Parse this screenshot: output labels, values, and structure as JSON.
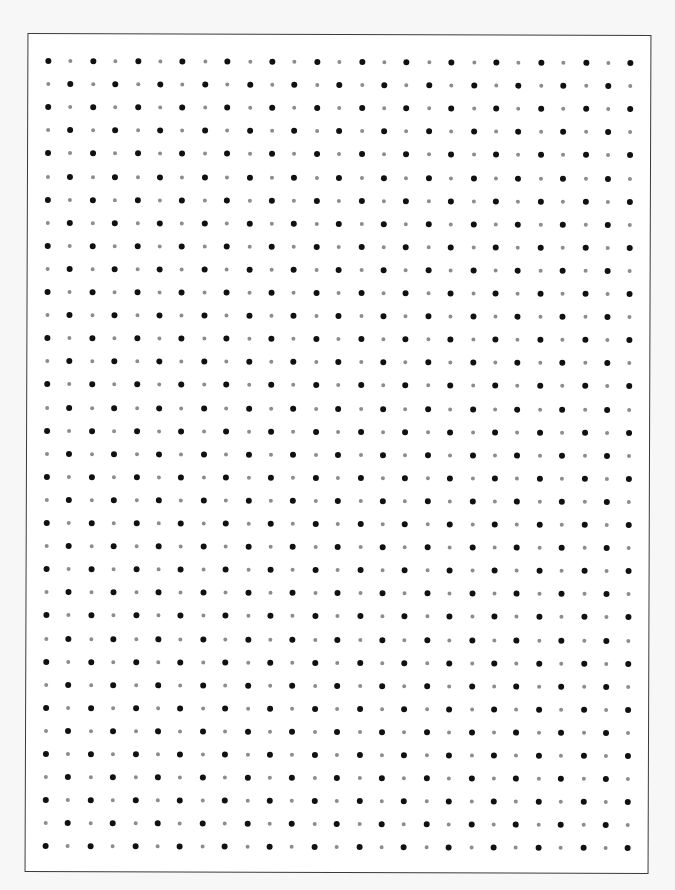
{
  "sheet": {
    "type": "dot-grid-paper",
    "columns": 27,
    "rows": 35,
    "pattern": "alternating-checkerboard",
    "first_dot": "dark",
    "spacing_x": 22.4,
    "spacing_y": 23.1,
    "origin_x": 20,
    "origin_y": 27,
    "colors": {
      "dark_dot": "#111111",
      "light_dot": "#8c8c8c",
      "border": "#3a3a3a",
      "paper": "#ffffff",
      "background": "#f7f7f7"
    }
  }
}
